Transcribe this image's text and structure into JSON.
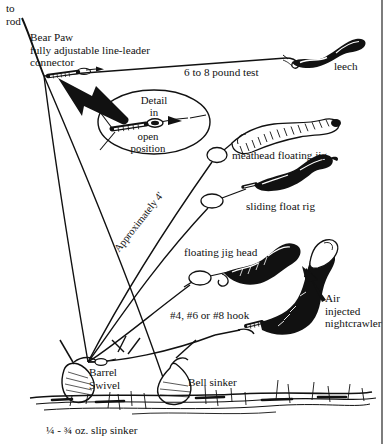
{
  "figure": {
    "ink_color": "#111111",
    "background_color": "#ffffff"
  },
  "labels": {
    "to_rod": "to\nrod",
    "bear_paw": "Bear Paw\nfully adjustable line-leader\nconnector",
    "pound_test": "6 to 8 pound test",
    "leech": "leech",
    "detail_line1": "Detail",
    "detail_line2": "in",
    "detail_line3": "open",
    "detail_line4": "position",
    "meathead": "meathead floating jig",
    "sliding_float": "sliding float rig",
    "floating_jig_head": "floating jig head",
    "hook_sizes": "#4, #6 or #8 hook",
    "air_injected": "Air\ninjected\nnightcrawler",
    "approximately": "Approximately 4'",
    "barrel_swivel": "Barrel\nSwivel",
    "bell_sinker": "Bell sinker",
    "slip_sinker": "¼ - ¾ oz. slip sinker"
  },
  "components": [
    {
      "name": "bear-paw-connector",
      "label": "Bear Paw fully adjustable line-leader connector"
    },
    {
      "name": "detail-callout",
      "label": "Detail in open position"
    },
    {
      "name": "leech-bait",
      "label": "leech"
    },
    {
      "name": "meathead-floating-jig",
      "label": "meathead floating jig"
    },
    {
      "name": "sliding-float-rig",
      "label": "sliding float rig"
    },
    {
      "name": "floating-jig-head",
      "label": "floating jig head"
    },
    {
      "name": "hook",
      "label": "#4, #6 or #8 hook"
    },
    {
      "name": "air-injected-nightcrawler",
      "label": "Air injected nightcrawler"
    },
    {
      "name": "barrel-swivel",
      "label": "Barrel Swivel"
    },
    {
      "name": "bell-sinker",
      "label": "Bell sinker"
    },
    {
      "name": "slip-sinker",
      "label": "¼ - ¾ oz. slip sinker"
    },
    {
      "name": "leader-length",
      "label": "Approximately 4'"
    },
    {
      "name": "main-line",
      "label": "6 to 8 pound test"
    }
  ]
}
